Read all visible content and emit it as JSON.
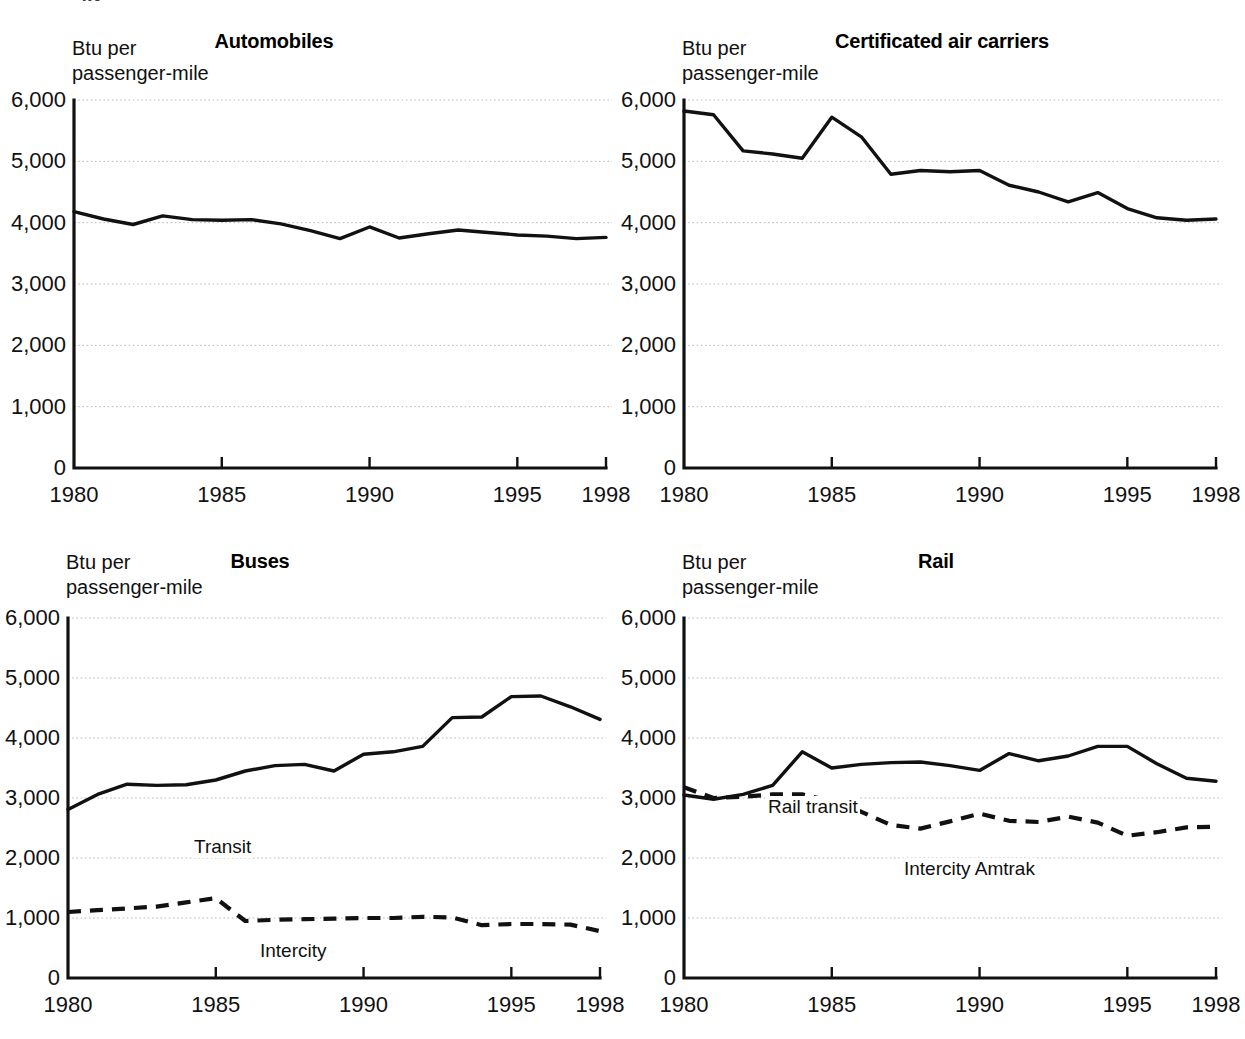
{
  "figure": {
    "cropped_top_fragment": "gy",
    "x_axis": {
      "label": "",
      "min": 1980,
      "max": 1998,
      "tick_values": [
        1980,
        1985,
        1990,
        1995,
        1998
      ],
      "tick_labels": [
        "1980",
        "1985",
        "1990",
        "1995",
        "1998"
      ]
    },
    "y_axis": {
      "caption_line1": "Btu per",
      "caption_line2": "passenger-mile",
      "min": 0,
      "max": 6000,
      "tick_values": [
        0,
        1000,
        2000,
        3000,
        4000,
        5000,
        6000
      ],
      "tick_labels": [
        "0",
        "1,000",
        "2,000",
        "3,000",
        "4,000",
        "5,000",
        "6,000"
      ]
    },
    "colors": {
      "line": "#111111",
      "gridline": "#b9b9b9",
      "axis": "#111111",
      "background": "#ffffff"
    }
  },
  "chart_data": [
    {
      "type": "line",
      "title": "Automobiles",
      "xlabel": "",
      "ylabel": "Btu per passenger-mile",
      "xlim": [
        1980,
        1998
      ],
      "ylim": [
        0,
        6000
      ],
      "grid": true,
      "legend": "none",
      "x": [
        1980,
        1981,
        1982,
        1983,
        1984,
        1985,
        1986,
        1987,
        1988,
        1989,
        1990,
        1991,
        1992,
        1993,
        1994,
        1995,
        1996,
        1997,
        1998
      ],
      "series": [
        {
          "name": "Automobiles",
          "style": "solid",
          "label_on_plot": "",
          "values": [
            4180,
            4060,
            3970,
            4110,
            4050,
            4040,
            4050,
            3980,
            3870,
            3740,
            3930,
            3750,
            3820,
            3880,
            3840,
            3800,
            3780,
            3740,
            3760
          ]
        }
      ]
    },
    {
      "type": "line",
      "title": "Certificated air carriers",
      "xlabel": "",
      "ylabel": "Btu per passenger-mile",
      "xlim": [
        1980,
        1998
      ],
      "ylim": [
        0,
        6000
      ],
      "grid": true,
      "legend": "none",
      "x": [
        1980,
        1981,
        1982,
        1983,
        1984,
        1985,
        1986,
        1987,
        1988,
        1989,
        1990,
        1991,
        1992,
        1993,
        1994,
        1995,
        1996,
        1997,
        1998
      ],
      "series": [
        {
          "name": "Certificated air carriers",
          "style": "solid",
          "label_on_plot": "",
          "values": [
            5820,
            5760,
            5170,
            5120,
            5050,
            5720,
            5400,
            4790,
            4850,
            4830,
            4850,
            4610,
            4500,
            4340,
            4490,
            4230,
            4080,
            4040,
            4060
          ]
        }
      ]
    },
    {
      "type": "line",
      "title": "Buses",
      "xlabel": "",
      "ylabel": "Btu per passenger-mile",
      "xlim": [
        1980,
        1998
      ],
      "ylim": [
        0,
        6000
      ],
      "grid": true,
      "legend": "on-plot",
      "x": [
        1980,
        1981,
        1982,
        1983,
        1984,
        1985,
        1986,
        1987,
        1988,
        1989,
        1990,
        1991,
        1992,
        1993,
        1994,
        1995,
        1996,
        1997,
        1998
      ],
      "series": [
        {
          "name": "Transit",
          "style": "solid",
          "label_on_plot": "Transit",
          "values": [
            2810,
            3060,
            3230,
            3210,
            3220,
            3300,
            3450,
            3540,
            3560,
            3450,
            3730,
            3770,
            3860,
            4340,
            4350,
            4690,
            4700,
            4520,
            4310
          ]
        },
        {
          "name": "Intercity",
          "style": "dashed",
          "label_on_plot": "Intercity",
          "values": [
            1100,
            1130,
            1160,
            1190,
            1260,
            1330,
            950,
            970,
            980,
            990,
            1000,
            1000,
            1020,
            1010,
            880,
            900,
            900,
            890,
            780
          ]
        }
      ]
    },
    {
      "type": "line",
      "title": "Rail",
      "xlabel": "",
      "ylabel": "Btu per passenger-mile",
      "xlim": [
        1980,
        1998
      ],
      "ylim": [
        0,
        6000
      ],
      "grid": true,
      "legend": "on-plot",
      "x": [
        1980,
        1981,
        1982,
        1983,
        1984,
        1985,
        1986,
        1987,
        1988,
        1989,
        1990,
        1991,
        1992,
        1993,
        1994,
        1995,
        1996,
        1997,
        1998
      ],
      "series": [
        {
          "name": "Rail transit",
          "style": "solid",
          "label_on_plot": "Rail transit",
          "values": [
            3050,
            2980,
            3060,
            3210,
            3770,
            3500,
            3560,
            3590,
            3600,
            3540,
            3460,
            3740,
            3620,
            3700,
            3860,
            3860,
            3570,
            3330,
            3280
          ]
        },
        {
          "name": "Intercity Amtrak",
          "style": "dashed",
          "label_on_plot": "Intercity Amtrak",
          "values": [
            3180,
            3000,
            3020,
            3060,
            3060,
            2950,
            2770,
            2550,
            2490,
            2610,
            2740,
            2620,
            2600,
            2690,
            2590,
            2370,
            2430,
            2510,
            2520
          ]
        }
      ]
    }
  ]
}
